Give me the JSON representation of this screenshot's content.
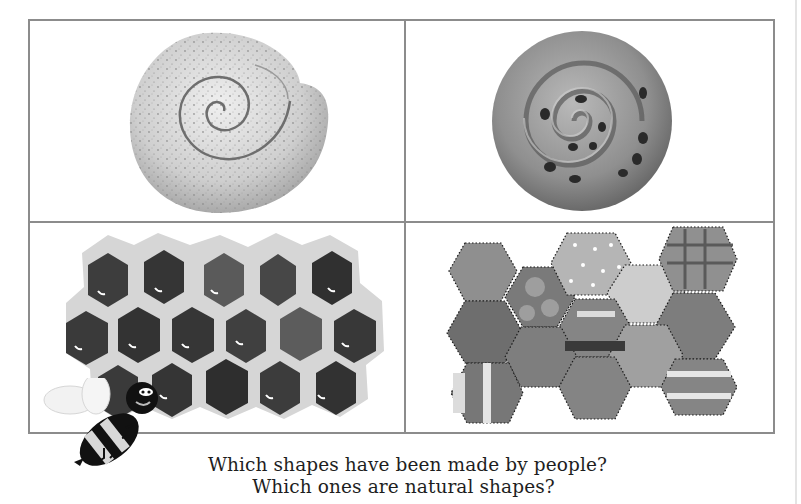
{
  "page": {
    "panels": [
      {
        "id": "shell",
        "label": "Ammonite shell spiral",
        "kind": "natural"
      },
      {
        "id": "bun",
        "label": "Currant bun spiral",
        "kind": "made-by-people"
      },
      {
        "id": "comb",
        "label": "Honeycomb hexagons",
        "kind": "natural"
      },
      {
        "id": "quilt",
        "label": "Patchwork hexagon quilt",
        "kind": "made-by-people"
      }
    ],
    "caption": {
      "line1": "Which shapes have been made by people?",
      "line2": "Which ones are natural shapes?"
    },
    "mascot": "bee",
    "colors": {
      "frame": "#8c8c8c",
      "text": "#1e1e1e",
      "background": "#ffffff"
    }
  }
}
